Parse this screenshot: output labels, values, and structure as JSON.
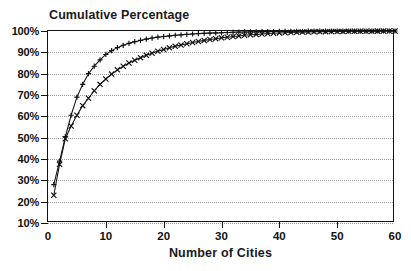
{
  "chart_data": {
    "type": "line",
    "title": "Cumulative Percentage",
    "xlabel": "Number of Cities",
    "ylabel": "",
    "xlim": [
      0,
      60
    ],
    "ylim": [
      10,
      100
    ],
    "grid": true,
    "grid_axis": "y",
    "legend": "none",
    "x_ticks": [
      0,
      10,
      20,
      30,
      40,
      50,
      60
    ],
    "x_tick_labels": [
      "0",
      "10",
      "20",
      "30",
      "40",
      "50",
      "60"
    ],
    "y_ticks": [
      10,
      20,
      30,
      40,
      50,
      60,
      70,
      80,
      90,
      100
    ],
    "y_tick_labels": [
      "10%",
      "20%",
      "30%",
      "40%",
      "50%",
      "60%",
      "70%",
      "80%",
      "90%",
      "100%"
    ],
    "x": [
      1,
      2,
      3,
      4,
      5,
      6,
      7,
      8,
      9,
      10,
      11,
      12,
      13,
      14,
      15,
      16,
      17,
      18,
      19,
      20,
      21,
      22,
      23,
      24,
      25,
      26,
      27,
      28,
      29,
      30,
      31,
      32,
      33,
      34,
      35,
      36,
      37,
      38,
      39,
      40,
      41,
      42,
      43,
      44,
      45,
      46,
      47,
      48,
      49,
      50,
      51,
      52,
      53,
      54,
      55,
      56,
      57,
      58,
      59,
      60
    ],
    "series": [
      {
        "name": "upper-series",
        "marker": "plus",
        "values": [
          28.0,
          39.0,
          50.5,
          60.5,
          69.0,
          75.0,
          80.0,
          83.5,
          86.5,
          89.0,
          90.8,
          92.2,
          93.3,
          94.2,
          95.0,
          95.6,
          96.2,
          96.7,
          97.1,
          97.4,
          97.7,
          98.0,
          98.2,
          98.4,
          98.6,
          98.8,
          98.9,
          99.0,
          99.1,
          99.2,
          99.3,
          99.4,
          99.5,
          99.55,
          99.6,
          99.65,
          99.7,
          99.73,
          99.76,
          99.79,
          99.82,
          99.84,
          99.86,
          99.88,
          99.9,
          99.91,
          99.92,
          99.93,
          99.94,
          99.95,
          99.96,
          99.96,
          99.97,
          99.97,
          99.98,
          99.98,
          99.99,
          99.99,
          100.0,
          100.0
        ]
      },
      {
        "name": "lower-series",
        "marker": "cross",
        "values": [
          23.0,
          37.5,
          49.5,
          55.5,
          60.5,
          65.0,
          68.5,
          72.0,
          75.0,
          77.5,
          79.8,
          81.8,
          83.5,
          85.0,
          86.3,
          87.5,
          88.6,
          89.6,
          90.5,
          91.3,
          92.1,
          92.8,
          93.4,
          94.0,
          94.6,
          95.1,
          95.6,
          96.0,
          96.4,
          96.8,
          97.1,
          97.4,
          97.7,
          98.0,
          98.2,
          98.4,
          98.6,
          98.8,
          98.95,
          99.1,
          99.2,
          99.3,
          99.4,
          99.48,
          99.55,
          99.6,
          99.65,
          99.7,
          99.74,
          99.78,
          99.81,
          99.84,
          99.86,
          99.88,
          99.9,
          99.92,
          99.94,
          99.96,
          99.98,
          100.0
        ]
      }
    ]
  }
}
